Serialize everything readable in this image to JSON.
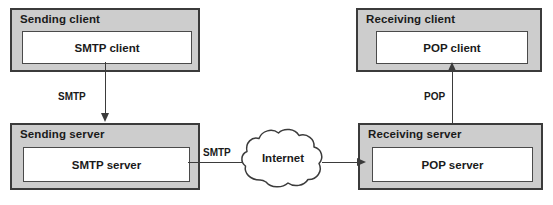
{
  "diagram": {
    "colors": {
      "host_fill": "#cdcdcd",
      "host_border": "#3b3b3b",
      "inner_fill": "#ffffff",
      "inner_border": "#4a4a4a",
      "line": "#3b3b3b",
      "text": "#1a1a1a",
      "background": "#ffffff"
    },
    "nodes": [
      {
        "id": "sending-client",
        "title": "Sending client",
        "inner": "SMTP client"
      },
      {
        "id": "receiving-client",
        "title": "Receiving client",
        "inner": "POP client"
      },
      {
        "id": "sending-server",
        "title": "Sending server",
        "inner": "SMTP server"
      },
      {
        "id": "receiving-server",
        "title": "Receiving server",
        "inner": "POP server"
      }
    ],
    "cloud": {
      "label": "Internet"
    },
    "edges": [
      {
        "id": "client-to-server-smtp",
        "label": "SMTP",
        "from": "sending-client",
        "to": "sending-server",
        "direction": "down"
      },
      {
        "id": "server-to-internet-smtp",
        "label": "SMTP",
        "from": "sending-server",
        "to": "internet",
        "direction": "right"
      },
      {
        "id": "internet-to-receiving-server",
        "label": "",
        "from": "internet",
        "to": "receiving-server",
        "direction": "right"
      },
      {
        "id": "server-to-client-pop",
        "label": "POP",
        "from": "receiving-server",
        "to": "receiving-client",
        "direction": "up"
      }
    ]
  }
}
